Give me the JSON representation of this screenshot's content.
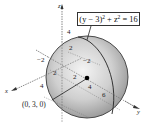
{
  "figure": {
    "type": "sphere-3d-diagram",
    "center_label": "(0, 3, 0)",
    "center": [
      0,
      3,
      0
    ],
    "radius": 4,
    "callout": {
      "lhs_base": "(y − 3)",
      "exp1": "2",
      "plus": " + z",
      "exp2": "2",
      "rhs": " = 16"
    },
    "axes": {
      "x_label": "x",
      "y_label": "y",
      "z_label": "z"
    },
    "ticks": {
      "z_top": "4",
      "z_2": "2",
      "x_neg2": "−2",
      "y_neg2": "−2",
      "x_2": "2",
      "y_2": "2",
      "x_4": "4",
      "y_4": "4",
      "y_6": "6"
    },
    "colors": {
      "sphere_light": "#f2f2f2",
      "sphere_dark": "#8c8c8c",
      "outline": "#333333",
      "background": "#ffffff"
    }
  }
}
